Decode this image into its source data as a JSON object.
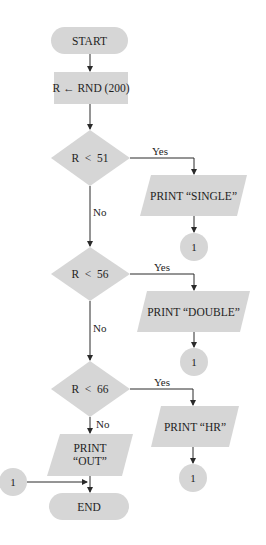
{
  "flowchart": {
    "start": {
      "label": "START"
    },
    "assign": {
      "label": "R ← RND (200)"
    },
    "decisions": [
      {
        "label": "R  <  51",
        "yes_label": "Yes",
        "no_label": "No"
      },
      {
        "label": "R  <  56",
        "yes_label": "Yes",
        "no_label": "No"
      },
      {
        "label": "R  <  66",
        "yes_label": "Yes",
        "no_label": "No"
      }
    ],
    "outputs": [
      {
        "label": "PRINT “SINGLE”"
      },
      {
        "label": "PRINT “DOUBLE”"
      },
      {
        "label": "PRINT “HR”"
      }
    ],
    "out_output": {
      "line1": "PRINT",
      "line2": "“OUT”"
    },
    "connectors": [
      {
        "label": "1"
      },
      {
        "label": "1"
      },
      {
        "label": "1"
      }
    ],
    "entry_connector": {
      "label": "1"
    },
    "end": {
      "label": "END"
    },
    "colors": {
      "fill": "#d6d6d6",
      "line": "#2a2a2a",
      "text": "#1e1e1e"
    }
  }
}
